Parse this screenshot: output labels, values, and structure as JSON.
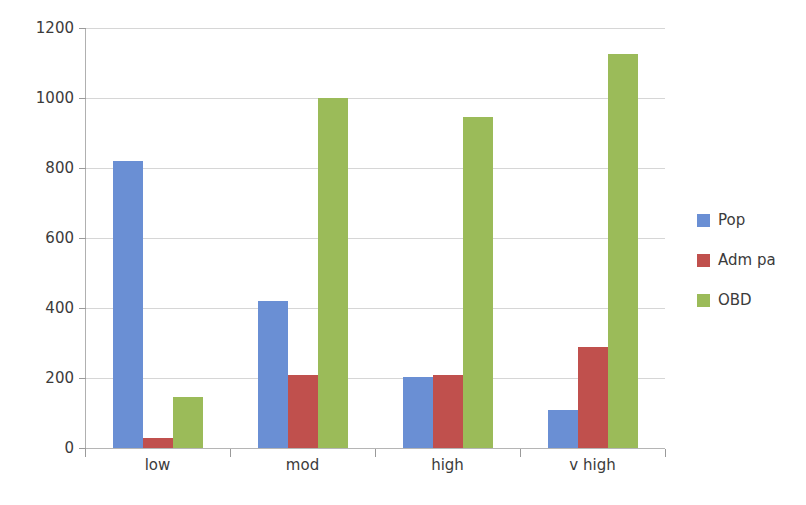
{
  "chart_data": {
    "type": "bar",
    "title": "",
    "subtitle": "",
    "xlabel": "",
    "ylabel": "",
    "categories": [
      "low",
      "mod",
      "high",
      "v high"
    ],
    "series": [
      {
        "name": "Pop",
        "color": "#6A8FD4",
        "values": [
          820,
          420,
          202,
          108
        ]
      },
      {
        "name": "Adm pa",
        "color": "#C0504D",
        "values": [
          28,
          208,
          208,
          290
        ]
      },
      {
        "name": "OBD",
        "color": "#9BBB59",
        "values": [
          145,
          1000,
          946,
          1126
        ]
      }
    ],
    "ylim": [
      0,
      1200
    ],
    "yticks": [
      0,
      200,
      400,
      600,
      800,
      1000,
      1200
    ],
    "ytick_labels": [
      "0",
      "200",
      "400",
      "600",
      "800",
      "1000",
      "1200"
    ],
    "grid": true,
    "grid_axis": "y",
    "legend_position": "right",
    "bar_group_layout": "grouped",
    "background_color": "#FFFFFF",
    "axis_color": "#B0B0B0",
    "grid_color": "#D6D6D6",
    "text_color": "#3B3B3B"
  },
  "legend": {
    "items": [
      {
        "label": "Pop",
        "color": "#6A8FD4"
      },
      {
        "label": "Adm pa",
        "color": "#C0504D"
      },
      {
        "label": "OBD",
        "color": "#9BBB59"
      }
    ]
  }
}
